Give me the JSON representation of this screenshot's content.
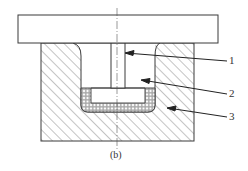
{
  "figure": {
    "caption": "(b)",
    "stroke_color": "#3a3a3a",
    "background": "#ffffff"
  },
  "callouts": [
    {
      "number": "1",
      "target": "stem"
    },
    {
      "number": "2",
      "target": "punch-cavity"
    },
    {
      "number": "3",
      "target": "die-body"
    }
  ]
}
